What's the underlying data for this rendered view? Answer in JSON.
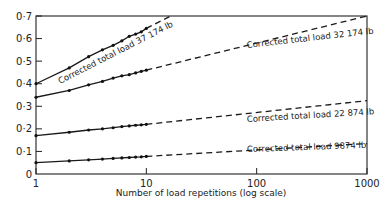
{
  "chart_data": {
    "type": "line",
    "title": "",
    "xlabel": "Number of load repetitions (log scale)",
    "ylabel": "",
    "xscale": "log",
    "xlim": [
      1,
      1000
    ],
    "ylim": [
      0,
      0.7
    ],
    "grid": false,
    "legend": "inline labels along lines",
    "x_ticks": [
      1,
      10,
      100,
      1000
    ],
    "x_tick_labels": [
      "1",
      "10",
      "100",
      "1000"
    ],
    "y_ticks": [
      0,
      0.1,
      0.2,
      0.3,
      0.4,
      0.5,
      0.6,
      0.7
    ],
    "y_tick_labels": [
      "0",
      "0·1",
      "0·2",
      "0·3",
      "0·4",
      "0·5",
      "0·6",
      "0·7"
    ],
    "series": [
      {
        "name": "Corrected total load 37 174 lb",
        "measured_x": [
          1,
          2,
          3,
          4,
          5,
          6,
          7,
          8,
          9,
          10
        ],
        "measured_y": [
          0.4,
          0.47,
          0.52,
          0.55,
          0.57,
          0.59,
          0.61,
          0.62,
          0.63,
          0.645
        ],
        "extrapolated": {
          "x": [
            10,
            16.6
          ],
          "y": [
            0.645,
            0.7
          ]
        }
      },
      {
        "name": "Corrected total load 32 174 lb",
        "measured_x": [
          1,
          2,
          3,
          4,
          5,
          6,
          7,
          8,
          9,
          10
        ],
        "measured_y": [
          0.34,
          0.37,
          0.395,
          0.41,
          0.425,
          0.435,
          0.44,
          0.448,
          0.455,
          0.46
        ],
        "extrapolated": {
          "x": [
            10,
            1000
          ],
          "y": [
            0.46,
            0.7
          ]
        }
      },
      {
        "name": "Corrected total load 22 874 lb",
        "measured_x": [
          1,
          2,
          3,
          4,
          5,
          6,
          7,
          8,
          9,
          10
        ],
        "measured_y": [
          0.17,
          0.185,
          0.195,
          0.2,
          0.205,
          0.21,
          0.213,
          0.216,
          0.218,
          0.22
        ],
        "extrapolated": {
          "x": [
            10,
            1000
          ],
          "y": [
            0.22,
            0.325
          ]
        }
      },
      {
        "name": "Corrected total load 9874 lb",
        "measured_x": [
          1,
          2,
          3,
          4,
          5,
          6,
          7,
          8,
          9,
          10
        ],
        "measured_y": [
          0.05,
          0.058,
          0.063,
          0.066,
          0.069,
          0.071,
          0.073,
          0.075,
          0.076,
          0.078
        ],
        "extrapolated": {
          "x": [
            10,
            1000
          ],
          "y": [
            0.078,
            0.135
          ]
        }
      }
    ]
  },
  "labels": {
    "xlabel": "Number of load repetitions (log scale)",
    "series": [
      "Corrected total load 37 174 lb",
      "Corrected total load 32 174 lb",
      "Corrected total load 22 874 lb",
      "Corrected total load 9874 lb"
    ]
  }
}
